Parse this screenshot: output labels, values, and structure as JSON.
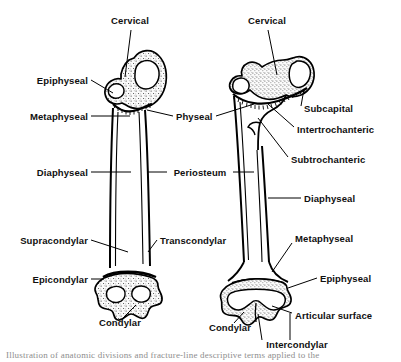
{
  "figure": {
    "background_color": "#ffffff",
    "ink_color": "#000000",
    "cancellous_fill_color": "#efefef",
    "width": 401,
    "height": 362
  },
  "bones": [
    {
      "id": "left-femur",
      "name": "Femur (child / immature, with open physes)",
      "label_count": 10
    },
    {
      "id": "right-femur",
      "name": "Femur (adult / mature)",
      "label_count": 10
    }
  ],
  "labels": [
    {
      "id": "cervical-left",
      "text": "Cervical",
      "x": 130,
      "y": 22,
      "align": "center",
      "bone": "left-femur"
    },
    {
      "id": "epiphyseal-left",
      "text": "Epiphyseal",
      "x": 88,
      "y": 83,
      "align": "right",
      "bone": "left-femur"
    },
    {
      "id": "metaphyseal-left",
      "text": "Metaphyseal",
      "x": 88,
      "y": 119,
      "align": "right",
      "bone": "left-femur"
    },
    {
      "id": "diaphyseal-left",
      "text": "Diaphyseal",
      "x": 88,
      "y": 175,
      "align": "right",
      "bone": "left-femur"
    },
    {
      "id": "supracondylar-left",
      "text": "Supracondylar",
      "x": 88,
      "y": 243,
      "align": "right",
      "bone": "left-femur"
    },
    {
      "id": "epicondylar-left",
      "text": "Epicondylar",
      "x": 88,
      "y": 282,
      "align": "right",
      "bone": "left-femur"
    },
    {
      "id": "condylar-left",
      "text": "Condylar",
      "x": 120,
      "y": 325,
      "align": "center",
      "bone": "left-femur"
    },
    {
      "id": "physeal",
      "text": "Physeal",
      "x": 176,
      "y": 119,
      "align": "left",
      "bone": "both"
    },
    {
      "id": "periosteum",
      "text": "Periosteum",
      "x": 200,
      "y": 175,
      "align": "center",
      "bone": "both"
    },
    {
      "id": "transcondylar",
      "text": "Transcondylar",
      "x": 160,
      "y": 243,
      "align": "left",
      "bone": "left-femur"
    },
    {
      "id": "cervical-right",
      "text": "Cervical",
      "x": 267,
      "y": 22,
      "align": "center",
      "bone": "right-femur"
    },
    {
      "id": "subcapital",
      "text": "Subcapital",
      "x": 304,
      "y": 111,
      "align": "left",
      "bone": "right-femur"
    },
    {
      "id": "intertrochanteric",
      "text": "Intertrochanteric",
      "x": 297,
      "y": 132,
      "align": "left",
      "bone": "right-femur"
    },
    {
      "id": "subtrochanteric",
      "text": "Subtrochanteric",
      "x": 291,
      "y": 162,
      "align": "left",
      "bone": "right-femur"
    },
    {
      "id": "diaphyseal-right",
      "text": "Diaphyseal",
      "x": 304,
      "y": 201,
      "align": "left",
      "bone": "right-femur"
    },
    {
      "id": "metaphyseal-right",
      "text": "Metaphyseal",
      "x": 295,
      "y": 241,
      "align": "left",
      "bone": "right-femur"
    },
    {
      "id": "epiphyseal-right",
      "text": "Epiphyseal",
      "x": 320,
      "y": 281,
      "align": "left",
      "bone": "right-femur"
    },
    {
      "id": "articular-surface",
      "text": "Articular surface",
      "x": 295,
      "y": 318,
      "align": "left",
      "bone": "right-femur"
    },
    {
      "id": "condylar-right",
      "text": "Condylar",
      "x": 230,
      "y": 330,
      "align": "center",
      "bone": "right-femur"
    },
    {
      "id": "intercondylar",
      "text": "Intercondylar",
      "x": 297,
      "y": 347,
      "align": "center",
      "bone": "right-femur"
    }
  ],
  "caption": {
    "text": "Illustration of anatomic divisions and fracture-line descriptive terms applied to the"
  }
}
